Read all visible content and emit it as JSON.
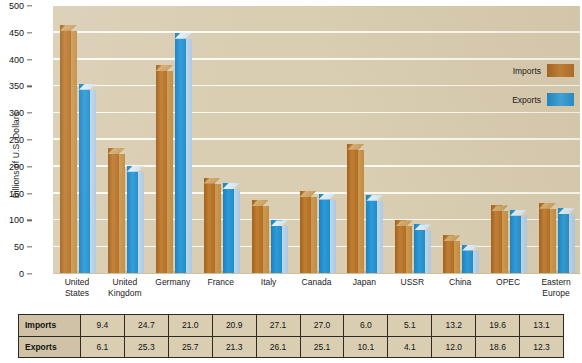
{
  "chart_data": {
    "type": "bar",
    "title": "",
    "xlabel": "",
    "ylabel": "Billions of U.S. Dollars",
    "ylim": [
      0,
      500
    ],
    "yticks": [
      0,
      50,
      100,
      150,
      200,
      250,
      300,
      350,
      400,
      450,
      500
    ],
    "grid": true,
    "legend_position": "right",
    "categories": [
      "United States",
      "United Kingdom",
      "Germany",
      "France",
      "Italy",
      "Canada",
      "Japan",
      "USSR",
      "China",
      "OPEC",
      "Eastern Europe"
    ],
    "category_lines": [
      [
        "United",
        "States"
      ],
      [
        "United",
        "Kingdom"
      ],
      [
        "Germany",
        ""
      ],
      [
        "France",
        ""
      ],
      [
        "Italy",
        ""
      ],
      [
        "Canada",
        ""
      ],
      [
        "Japan",
        ""
      ],
      [
        "USSR",
        ""
      ],
      [
        "China",
        ""
      ],
      [
        "OPEC",
        ""
      ],
      [
        "Eastern",
        "Europe"
      ]
    ],
    "series": [
      {
        "name": "Imports",
        "color": "#b5702a",
        "values": [
          465,
          235,
          390,
          180,
          138,
          155,
          243,
          100,
          72,
          128,
          133
        ]
      },
      {
        "name": "Exports",
        "color": "#2e9ad4",
        "values": [
          355,
          202,
          450,
          170,
          100,
          150,
          148,
          93,
          55,
          120,
          123
        ]
      }
    ]
  },
  "legend": {
    "items": [
      {
        "label": "Imports",
        "swatch": "imports-swatch"
      },
      {
        "label": "Exports",
        "swatch": "exports-swatch"
      }
    ]
  },
  "table": {
    "rows": [
      {
        "header": "Imports",
        "values": [
          "9.4",
          "24.7",
          "21.0",
          "20.9",
          "27.1",
          "27.0",
          "6.0",
          "5.1",
          "13.2",
          "19.6",
          "13.1"
        ]
      },
      {
        "header": "Exports",
        "values": [
          "6.1",
          "25.3",
          "25.7",
          "21.3",
          "26.1",
          "25.1",
          "10.1",
          "4.1",
          "12.0",
          "18.6",
          "12.3"
        ]
      }
    ]
  },
  "colors": {
    "plot_background": "#d9cdb2",
    "gridline": "#fdfbf4",
    "imports": "#b5702a",
    "exports": "#2e9ad4",
    "text": "#131313"
  }
}
